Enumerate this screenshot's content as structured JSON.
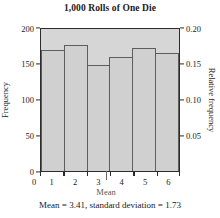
{
  "chart_data": {
    "type": "bar",
    "title": "1,000 Rolls of One Die",
    "xlabel": "",
    "ylabel": "Frequency",
    "y2label": "Relative frequency",
    "categories": [
      "1",
      "2",
      "3",
      "4",
      "5",
      "6"
    ],
    "values": [
      170,
      177,
      149,
      161,
      173,
      166
    ],
    "relative_values": [
      0.17,
      0.177,
      0.149,
      0.161,
      0.173,
      0.166
    ],
    "ylim": [
      0,
      200
    ],
    "y2lim": [
      0,
      0.2
    ],
    "yticks": [
      "0",
      "50",
      "100",
      "150",
      "200"
    ],
    "ytick_values": [
      0,
      50,
      100,
      150,
      200
    ],
    "y2ticks": [
      "0.05",
      "0.10",
      "0.15",
      "0.20"
    ],
    "y2tick_values": [
      0.05,
      0.1,
      0.15,
      0.2
    ],
    "xticks": [
      "0",
      "1",
      "2",
      "3",
      "4",
      "5",
      "6"
    ],
    "xtick_values": [
      0,
      1,
      2,
      3,
      4,
      5,
      6
    ],
    "grid": false,
    "legend": "none",
    "annotations": [
      {
        "name": "mean-marker",
        "label": "Mean",
        "x_value": 3.41
      }
    ],
    "caption": "Mean = 3.41, standard deviation = 1.73",
    "colors": {
      "plot_background": "#d6d6d6",
      "bar_fill": "#d0d0d0",
      "bar_border": "#5d5d5d",
      "frame": "#2c2c2c",
      "text": "#1a1a1a",
      "annotation": "#5a5a5a"
    },
    "statistics": {
      "mean": "3.41",
      "standard_deviation": "1.73"
    }
  }
}
